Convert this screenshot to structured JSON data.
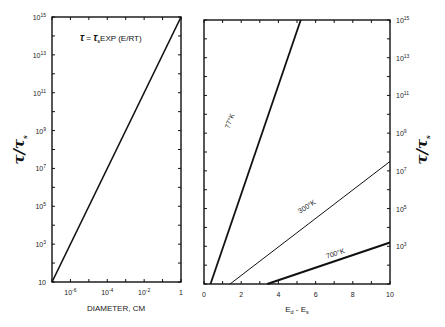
{
  "chart_data": [
    {
      "type": "line",
      "panel": "left",
      "title": "",
      "annotation": "τ = τs EXP (E/RT)",
      "xlabel": "DIAMETER, CM",
      "ylabel": "τ/τs",
      "xscale": "log",
      "yscale": "log",
      "xlim_log10": [
        -7,
        0
      ],
      "ylim_log10": [
        1,
        15
      ],
      "x_tick_labels": [
        {
          "log": -6,
          "base": "10",
          "exp": "-6"
        },
        {
          "log": -4,
          "base": "10",
          "exp": "-4"
        },
        {
          "log": -2,
          "base": "10",
          "exp": "-2"
        },
        {
          "log": 0,
          "base": "1",
          "exp": ""
        }
      ],
      "y_tick_labels": [
        {
          "log": 15,
          "base": "10",
          "exp": "15"
        },
        {
          "log": 13,
          "base": "10",
          "exp": "13"
        },
        {
          "log": 11,
          "base": "10",
          "exp": "11"
        },
        {
          "log": 9,
          "base": "10",
          "exp": "9"
        },
        {
          "log": 7,
          "base": "10",
          "exp": "7"
        },
        {
          "log": 5,
          "base": "10",
          "exp": "5"
        },
        {
          "log": 3,
          "base": "10",
          "exp": "3"
        },
        {
          "log": 1,
          "base": "10",
          "exp": ""
        }
      ],
      "grid": false,
      "series": [
        {
          "name": "diameter",
          "x_log10": [
            -7,
            0
          ],
          "y_log10": [
            1,
            15
          ],
          "width": 1.6
        }
      ]
    },
    {
      "type": "line",
      "panel": "right",
      "title": "",
      "xlabel": "Ed - Es",
      "ylabel": "τ/τs",
      "xscale": "linear",
      "yscale": "log",
      "xlim": [
        0,
        10
      ],
      "ylim_log10": [
        1,
        15
      ],
      "x_tick_labels": [
        0,
        2,
        4,
        6,
        8,
        10
      ],
      "y_tick_labels": [
        {
          "log": 15,
          "base": "10",
          "exp": "15"
        },
        {
          "log": 13,
          "base": "10",
          "exp": "13"
        },
        {
          "log": 11,
          "base": "10",
          "exp": "11"
        },
        {
          "log": 9,
          "base": "10",
          "exp": "9"
        },
        {
          "log": 7,
          "base": "10",
          "exp": "7"
        },
        {
          "log": 5,
          "base": "10",
          "exp": "5"
        },
        {
          "log": 3,
          "base": "10",
          "exp": "3"
        }
      ],
      "grid": false,
      "series": [
        {
          "name": "77°K",
          "x": [
            0.35,
            5.2
          ],
          "y_log10": [
            1,
            15
          ],
          "width": 1.8,
          "label_pos": {
            "x": 1.5,
            "y_log10": 9.6,
            "angle": -70
          }
        },
        {
          "name": "300°K",
          "x": [
            1.4,
            10
          ],
          "y_log10": [
            1,
            7.5
          ],
          "width": 1.0,
          "label_pos": {
            "x": 5.6,
            "y_log10": 5.0,
            "angle": -33
          }
        },
        {
          "name": "700°K",
          "x": [
            3.4,
            10
          ],
          "y_log10": [
            1,
            3.2
          ],
          "width": 2.0,
          "label_pos": {
            "x": 7.1,
            "y_log10": 2.5,
            "angle": -18
          }
        }
      ]
    }
  ],
  "labels": {
    "left_ylabel": "τ/τs",
    "right_ylabel": "τ/τs",
    "formula_tau": "τ",
    "formula_eq": " = ",
    "formula_tau2": "τ",
    "formula_sub": "s",
    "formula_rest": "EXP  (E/RT)",
    "left_xlabel": "DIAMETER, CM",
    "right_xlabel_main": "E",
    "right_xlabel_sub1": "d",
    "right_xlabel_dash": " - E",
    "right_xlabel_sub2": "s"
  }
}
